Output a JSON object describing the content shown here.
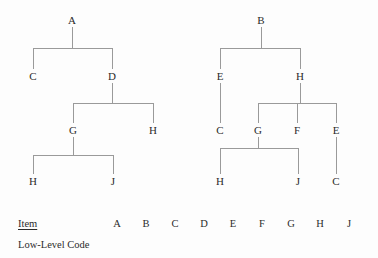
{
  "page": {
    "background_color": "#fdfdfd",
    "line_color": "#9a9a9a",
    "text_color": "#2b2b2b",
    "width": 378,
    "height": 258
  },
  "trees": [
    {
      "name": "tree-a",
      "root": "A",
      "nodes": [
        {
          "id": "a-root",
          "label": "A",
          "x": 72,
          "y": 20
        },
        {
          "id": "a-c",
          "label": "C",
          "x": 33,
          "y": 76
        },
        {
          "id": "a-d",
          "label": "D",
          "x": 112,
          "y": 76
        },
        {
          "id": "a-g",
          "label": "G",
          "x": 73,
          "y": 130
        },
        {
          "id": "a-h1",
          "label": "H",
          "x": 153,
          "y": 130
        },
        {
          "id": "a-h2",
          "label": "H",
          "x": 33,
          "y": 181
        },
        {
          "id": "a-j",
          "label": "J",
          "x": 113,
          "y": 181
        }
      ],
      "edges": [
        {
          "parent": "A",
          "children": [
            "C",
            "D"
          ]
        },
        {
          "parent": "D",
          "children": [
            "G",
            "H"
          ]
        },
        {
          "parent": "G",
          "children": [
            "H",
            "J"
          ]
        }
      ]
    },
    {
      "name": "tree-b",
      "root": "B",
      "nodes": [
        {
          "id": "b-root",
          "label": "B",
          "x": 261,
          "y": 20
        },
        {
          "id": "b-e1",
          "label": "E",
          "x": 220,
          "y": 76
        },
        {
          "id": "b-h1",
          "label": "H",
          "x": 300,
          "y": 76
        },
        {
          "id": "b-c1",
          "label": "C",
          "x": 220,
          "y": 130
        },
        {
          "id": "b-g",
          "label": "G",
          "x": 258,
          "y": 130
        },
        {
          "id": "b-f",
          "label": "F",
          "x": 297,
          "y": 130
        },
        {
          "id": "b-e2",
          "label": "E",
          "x": 336,
          "y": 130
        },
        {
          "id": "b-h2",
          "label": "H",
          "x": 220,
          "y": 181
        },
        {
          "id": "b-j",
          "label": "J",
          "x": 298,
          "y": 181
        },
        {
          "id": "b-c2",
          "label": "C",
          "x": 336,
          "y": 181
        }
      ],
      "edges": [
        {
          "parent": "B",
          "children": [
            "E",
            "H"
          ]
        },
        {
          "parent": "E",
          "children": [
            "C"
          ]
        },
        {
          "parent": "H",
          "children": [
            "G",
            "F",
            "E"
          ]
        },
        {
          "parent": "G",
          "children": [
            "H",
            "J"
          ]
        },
        {
          "parent": "E",
          "children": [
            "C"
          ]
        }
      ]
    }
  ],
  "table": {
    "rows": [
      {
        "label": "Item",
        "underlined": true
      },
      {
        "label": "Low-Level Code",
        "underlined": false
      }
    ],
    "columns": [
      {
        "label": "A",
        "x": 117
      },
      {
        "label": "B",
        "x": 146
      },
      {
        "label": "C",
        "x": 175
      },
      {
        "label": "D",
        "x": 204
      },
      {
        "label": "E",
        "x": 233
      },
      {
        "label": "F",
        "x": 262
      },
      {
        "label": "G",
        "x": 291
      },
      {
        "label": "H",
        "x": 320
      },
      {
        "label": "J",
        "x": 349
      }
    ]
  }
}
